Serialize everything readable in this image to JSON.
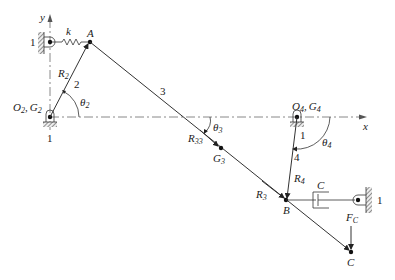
{
  "diagram": {
    "axes": {
      "x_label": "x",
      "y_label": "y"
    },
    "ground_label": "1",
    "points": {
      "A": "A",
      "B": "B",
      "C": "C",
      "O2": "O",
      "O2_sub": "2",
      "G2": "G",
      "G2_sub": "2",
      "O4": "O",
      "O4_sub": "4",
      "G4": "G",
      "G4_sub": "4",
      "G3": "G",
      "G3_sub": "3"
    },
    "links": {
      "link2": "2",
      "link3": "3",
      "link4": "4"
    },
    "vectors": {
      "R2": "R",
      "R2_sub": "2",
      "R33": "R",
      "R33_sub": "33",
      "R3": "R",
      "R3_sub": "3",
      "R4": "R",
      "R4_sub": "4"
    },
    "angles": {
      "theta2": "θ",
      "theta2_sub": "2",
      "theta3": "θ",
      "theta3_sub": "3",
      "theta4": "θ",
      "theta4_sub": "4"
    },
    "elements": {
      "spring": "k",
      "damper": "C",
      "force": "F",
      "force_sub": "C"
    },
    "separator": ","
  }
}
